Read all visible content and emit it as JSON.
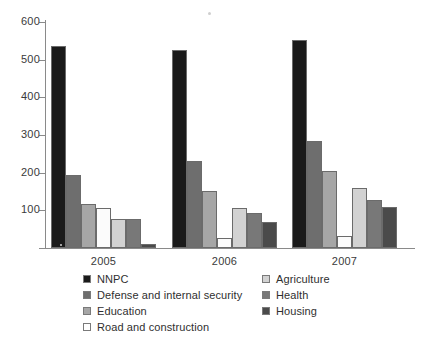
{
  "chart_data": {
    "type": "bar",
    "title": "",
    "subtitle": "",
    "xlabel": "",
    "ylabel": "",
    "categories": [
      "2005",
      "2006",
      "2007"
    ],
    "ylim": [
      0,
      600
    ],
    "yticks": [
      100,
      200,
      300,
      400,
      500,
      600
    ],
    "ytick_labels": [
      "100",
      "200",
      "300",
      "400",
      "500",
      "600"
    ],
    "grid": false,
    "legend_position": "bottom",
    "series": [
      {
        "name": "NNPC",
        "color": "#1a1a1a",
        "values": [
          535,
          527,
          552
        ]
      },
      {
        "name": "Defense and internal security",
        "color": "#6e6e6e",
        "values": [
          195,
          232,
          283
        ]
      },
      {
        "name": "Education",
        "color": "#a6a6a6",
        "values": [
          118,
          152,
          204
        ]
      },
      {
        "name": "Road and construction",
        "color": "#fbfbfb",
        "values": [
          105,
          27,
          33
        ]
      },
      {
        "name": "Agriculture",
        "color": "#d2d2d2",
        "values": [
          78,
          107,
          159
        ]
      },
      {
        "name": "Health",
        "color": "#787878",
        "values": [
          78,
          93,
          128
        ]
      },
      {
        "name": "Housing",
        "color": "#4a4a4a",
        "values": [
          10,
          70,
          108
        ]
      }
    ]
  },
  "legend": {
    "left_column": [
      {
        "label": "NNPC",
        "color": "#1a1a1a"
      },
      {
        "label": "Defense and internal security",
        "color": "#6e6e6e"
      },
      {
        "label": "Education",
        "color": "#a6a6a6"
      },
      {
        "label": "Road and construction",
        "color": "#ffffff"
      }
    ],
    "right_column": [
      {
        "label": "Agriculture",
        "color": "#d2d2d2"
      },
      {
        "label": "Health",
        "color": "#787878"
      },
      {
        "label": "Housing",
        "color": "#4a4a4a"
      }
    ]
  },
  "axis": {
    "y_tick_labels": [
      "600",
      "500",
      "400",
      "300",
      "200",
      "100"
    ],
    "x_tick_labels": [
      "2005",
      "2006",
      "2007"
    ]
  }
}
